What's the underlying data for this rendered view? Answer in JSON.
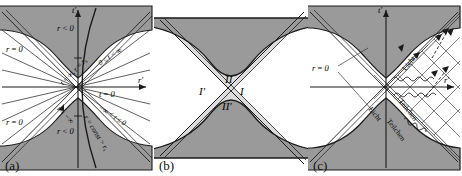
{
  "figure": {
    "colors": {
      "shaded_region": "#9a9a9a",
      "light_shaded_region": "#d9d9d9",
      "curve": "#1a1a1a",
      "axis": "#1a1a1a",
      "background": "#ffffff"
    }
  },
  "panels": [
    {
      "id": "a",
      "caption": "(a)",
      "axes": {
        "vertical": "t′",
        "horizontal": "r′"
      },
      "labels": {
        "r_zero_upper_left": "r = 0",
        "r_zero_lower_left": "r = 0",
        "r_negative_upper": "r < 0",
        "r_negative_lower": "r < 0",
        "t_eq_zero": "t = 0",
        "t_range_positive": "0 ≤ t < ∞",
        "t_range_negative": "−∞ < t ≤ 0",
        "horizon_future": "t = ∞, r = r",
        "horizon_future_sub": "s",
        "horizon_past": "t = −∞",
        "r_const": "r = const > r",
        "r_const_sub": "s"
      }
    },
    {
      "id": "b",
      "caption": "(b)",
      "regions": {
        "top": "II",
        "left": "I′",
        "right": "I",
        "bottom": "II′"
      }
    },
    {
      "id": "c",
      "caption": "(c)",
      "axes": {
        "vertical": "t′",
        "horizontal": "r′"
      },
      "labels": {
        "r_zero": "r = 0",
        "light_upper": "Licht",
        "particle_upper": "Teilchen",
        "light_lower": "Licht",
        "particle_lower": "Teilchen"
      }
    }
  ]
}
